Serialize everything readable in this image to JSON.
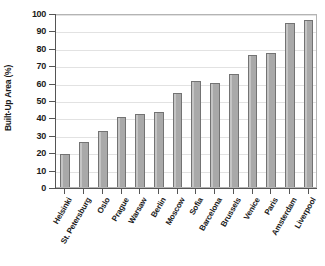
{
  "chart_data": {
    "type": "bar",
    "title": "",
    "xlabel": "",
    "ylabel": "Built-Up Area (%)",
    "ylim": [
      0,
      100
    ],
    "ytick_labels": [
      "0",
      "10",
      "20",
      "30",
      "40",
      "50",
      "60",
      "70",
      "80",
      "90",
      "100"
    ],
    "ytick_values": [
      0,
      10,
      20,
      30,
      40,
      50,
      60,
      70,
      80,
      90,
      100
    ],
    "grid": true,
    "legend": null,
    "categories": [
      "Helsinki",
      "St. Petersburg",
      "Oslo",
      "Prague",
      "Warsaw",
      "Berlin",
      "Moscow",
      "Sofia",
      "Barcelona",
      "Brussels",
      "Venice",
      "Paris",
      "Amsterdam",
      "Liverpool"
    ],
    "values": [
      19,
      26,
      32,
      40,
      42,
      43,
      54,
      61,
      60,
      65,
      76,
      77,
      94,
      96
    ],
    "colors": {
      "bar_fill": "#a9a9a9",
      "bar_edge": "#737373",
      "gridline": "#e2e2e2",
      "axis": "#555555",
      "frame": "#b4b4b4",
      "background": "#ffffff",
      "text": "#1a1a1a"
    }
  }
}
